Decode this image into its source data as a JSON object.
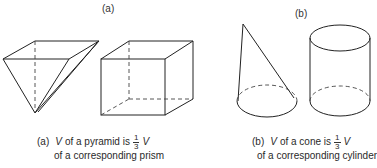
{
  "panels": [
    {
      "id": "a",
      "header": "(a)",
      "shapes": [
        "pyramid",
        "prism"
      ],
      "caption": {
        "tag": "(a)",
        "variable": "V",
        "text_before_fraction": "of a pyramid is",
        "fraction": {
          "numerator": "1",
          "denominator": "3"
        },
        "variable_after": "V",
        "line2": "of a corresponding prism"
      }
    },
    {
      "id": "b",
      "header": "(b)",
      "shapes": [
        "cone",
        "cylinder"
      ],
      "caption": {
        "tag": "(b)",
        "variable": "V",
        "text_before_fraction": "of a cone is",
        "fraction": {
          "numerator": "1",
          "denominator": "3"
        },
        "variable_after": "V",
        "line2": "of a corresponding cylinder"
      }
    }
  ]
}
